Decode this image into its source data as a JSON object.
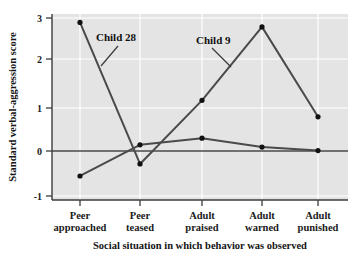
{
  "chart_data": {
    "type": "line",
    "title": "",
    "subtitle": "",
    "xlabel": "Social situation in which behavior was observed",
    "ylabel": "Standard verbal-aggression score",
    "categories": [
      "Peer approached",
      "Peer teased",
      "Adult praised",
      "Adult warned",
      "Adult punished"
    ],
    "category_lines": [
      [
        "Peer",
        "approached"
      ],
      [
        "Peer",
        "teased"
      ],
      [
        "Adult",
        "praised"
      ],
      [
        "Adult",
        "warned"
      ],
      [
        "Adult",
        "punished"
      ]
    ],
    "series": [
      {
        "name": "Child 28",
        "values": [
          2.9,
          -0.28,
          1.15,
          2.8,
          0.78
        ]
      },
      {
        "name": "Child 9",
        "values": [
          -0.55,
          0.15,
          0.3,
          0.1,
          0.02
        ]
      }
    ],
    "ylim": [
      -1,
      3
    ],
    "yticks": [
      -1,
      0,
      1,
      2,
      3
    ],
    "ytick_labels": [
      "-1",
      "0",
      "1",
      "2",
      "3"
    ],
    "grid": true,
    "grid_color": "#ffffff",
    "plot_background": "#e4e4e4",
    "line_color": "#4a4a4a",
    "marker_color": "#111111",
    "zero_line": 0,
    "legend": "annotations-on-plot",
    "annotations": [
      {
        "text": "Child 28",
        "series": "Child 28"
      },
      {
        "text": "Child 9",
        "series": "Child 9"
      }
    ]
  },
  "axis": {
    "y_title": "Standard verbal-aggression score",
    "x_title": "Social situation in which behavior was observed",
    "y_tick_0": "3",
    "y_tick_1": "2",
    "y_tick_2": "1",
    "y_tick_3": "0",
    "y_tick_4": "-1"
  },
  "categories": {
    "c0_line1": "Peer",
    "c0_line2": "approached",
    "c1_line1": "Peer",
    "c1_line2": "teased",
    "c2_line1": "Adult",
    "c2_line2": "praised",
    "c3_line1": "Adult",
    "c3_line2": "warned",
    "c4_line1": "Adult",
    "c4_line2": "punished"
  },
  "annotations": {
    "child28": "Child 28",
    "child9": "Child 9"
  },
  "colors": {
    "plot_background": "#e4e4e4",
    "gridline": "#ffffff",
    "line": "#4a4a4a",
    "marker": "#111111",
    "axis": "#3c3c3c",
    "text": "#141414"
  }
}
